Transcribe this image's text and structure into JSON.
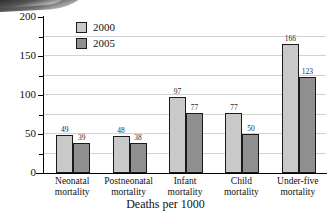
{
  "chart_data": {
    "type": "bar",
    "title": "",
    "subtitle": "",
    "xlabel": "Deaths per 1000",
    "ylabel": "",
    "ylim": [
      0,
      200
    ],
    "yticks": [
      0,
      50,
      100,
      150,
      200
    ],
    "ytick_labels": [
      "0",
      "50",
      "100",
      "150",
      "200"
    ],
    "yminor_ticks": [
      25,
      75,
      125,
      175
    ],
    "gridlines": [
      25,
      50,
      75,
      100,
      125,
      150,
      175
    ],
    "grid": true,
    "legend_position": "top-left-inside",
    "categories": [
      "Neonatal mortality",
      "Postneonatal mortality",
      "Infant mortality",
      "Child mortality",
      "Under-five mortality"
    ],
    "category_lines": [
      [
        "Neonatal",
        "mortality"
      ],
      [
        "Postneonatal",
        "mortality"
      ],
      [
        "Infant",
        "mortality"
      ],
      [
        "Child",
        "mortality"
      ],
      [
        "Under-five",
        "mortality"
      ]
    ],
    "series": [
      {
        "name": "2000",
        "color": "#c9c9c9",
        "values": [
          49,
          48,
          97,
          77,
          166
        ],
        "labels": [
          "49",
          "48",
          "97",
          "77",
          "166"
        ]
      },
      {
        "name": "2005",
        "color": "#8f8f8f",
        "values": [
          39,
          38,
          77,
          50,
          123
        ],
        "labels": [
          "39",
          "38",
          "77",
          "50",
          "123"
        ]
      }
    ]
  },
  "legend": {
    "items": [
      {
        "label": "2000",
        "color": "#c9c9c9"
      },
      {
        "label": "2005",
        "color": "#8f8f8f"
      }
    ]
  },
  "axis": {
    "y_labels": [
      "200",
      "150",
      "100",
      "50",
      "0"
    ],
    "x_title": "Deaths per 1000"
  },
  "colors": {
    "series_2000": "#c9c9c9",
    "series_2005": "#8f8f8f",
    "axis": "#000000",
    "grid": "#d2d2d2",
    "background": "#ffffff"
  }
}
